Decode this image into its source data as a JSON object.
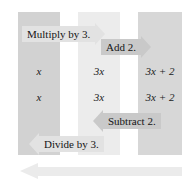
{
  "diagram": {
    "colors": {
      "column_outer": "#d2d2d2",
      "column_middle": "#ececec",
      "column_right": "#d7d7d7",
      "banner_light": "#e2e2e2",
      "banner_dark": "#c9c9c9",
      "return_arrow": "#ebebeb",
      "text": "#151515"
    },
    "columns": [
      {
        "name": "column-x",
        "fill": "#d2d2d2"
      },
      {
        "name": "column-3x",
        "fill": "#ececec"
      },
      {
        "name": "column-3x-plus-2",
        "fill": "#d7d7d7"
      }
    ],
    "forward_operations": [
      {
        "label": "Multiply by 3.",
        "direction": "right",
        "tone": "light"
      },
      {
        "label": "Add 2.",
        "direction": "right",
        "tone": "dark"
      }
    ],
    "inverse_operations": [
      {
        "label": "Subtract 2.",
        "direction": "left",
        "tone": "dark"
      },
      {
        "label": "Divide by 3.",
        "direction": "left",
        "tone": "light"
      }
    ],
    "rows": [
      {
        "name": "forward-row",
        "cells": [
          {
            "name": "cell-x",
            "text": "x",
            "italic": true
          },
          {
            "name": "cell-3x",
            "text": "3x",
            "italic": true
          },
          {
            "name": "cell-3x-plus-2",
            "text": "3x + 2",
            "italic": true
          }
        ]
      },
      {
        "name": "inverse-row",
        "cells": [
          {
            "name": "cell-x",
            "text": "x",
            "italic": true
          },
          {
            "name": "cell-3x",
            "text": "3x",
            "italic": true
          },
          {
            "name": "cell-3x-plus-2",
            "text": "3x + 2",
            "italic": true
          }
        ]
      }
    ],
    "return_arrow": {
      "name": "return-arrow",
      "direction": "left"
    }
  }
}
